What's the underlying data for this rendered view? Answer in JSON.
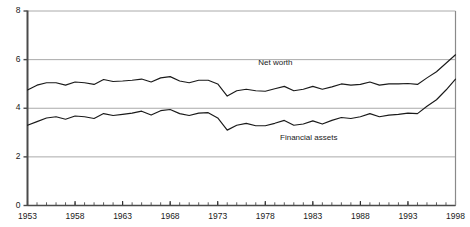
{
  "chart_data": {
    "type": "line",
    "title": "",
    "title_fragment": "Ratio",
    "xlabel": "",
    "ylabel": "",
    "xlim": [
      1953,
      1998
    ],
    "ylim": [
      0,
      8
    ],
    "yticks": [
      0,
      2,
      4,
      6,
      8
    ],
    "ytick_labels": [
      "0",
      "2",
      "4",
      "6",
      "8"
    ],
    "xticks": [
      1953,
      1958,
      1963,
      1968,
      1973,
      1978,
      1983,
      1988,
      1993,
      1998
    ],
    "xtick_labels": [
      "1953",
      "1958",
      "1963",
      "1968",
      "1973",
      "1978",
      "1983",
      "1988",
      "1993",
      "1998"
    ],
    "minor_xtick_interval": 1,
    "grid": "horizontal",
    "grid_color": "#aaaaaa",
    "line_color": "#1a1a1a",
    "legend_position": "inline-annotation",
    "x": [
      1953,
      1954,
      1955,
      1956,
      1957,
      1958,
      1959,
      1960,
      1961,
      1962,
      1963,
      1964,
      1965,
      1966,
      1967,
      1968,
      1969,
      1970,
      1971,
      1972,
      1973,
      1974,
      1975,
      1976,
      1977,
      1978,
      1979,
      1980,
      1981,
      1982,
      1983,
      1984,
      1985,
      1986,
      1987,
      1988,
      1989,
      1990,
      1991,
      1992,
      1993,
      1994,
      1995,
      1996,
      1997,
      1998
    ],
    "series": [
      {
        "name": "Net worth",
        "label": "Net worth",
        "label_x": 1979.2,
        "label_y": 5.85,
        "values": [
          4.75,
          4.95,
          5.05,
          5.05,
          4.95,
          5.08,
          5.05,
          4.98,
          5.18,
          5.1,
          5.12,
          5.15,
          5.2,
          5.08,
          5.25,
          5.3,
          5.12,
          5.05,
          5.15,
          5.15,
          5.0,
          4.5,
          4.72,
          4.78,
          4.72,
          4.7,
          4.8,
          4.9,
          4.72,
          4.78,
          4.9,
          4.78,
          4.88,
          5.0,
          4.95,
          4.98,
          5.08,
          4.95,
          5.0,
          5.0,
          5.02,
          4.98,
          5.25,
          5.5,
          5.85,
          6.2
        ]
      },
      {
        "name": "Financial assets",
        "label": "Financial assets",
        "label_x": 1983.0,
        "label_y": 2.78,
        "values": [
          3.3,
          3.45,
          3.6,
          3.65,
          3.55,
          3.68,
          3.65,
          3.58,
          3.78,
          3.7,
          3.75,
          3.8,
          3.88,
          3.72,
          3.9,
          3.95,
          3.78,
          3.7,
          3.8,
          3.82,
          3.6,
          3.1,
          3.3,
          3.38,
          3.28,
          3.28,
          3.38,
          3.5,
          3.3,
          3.35,
          3.48,
          3.35,
          3.5,
          3.62,
          3.58,
          3.65,
          3.78,
          3.65,
          3.72,
          3.75,
          3.8,
          3.78,
          4.08,
          4.35,
          4.75,
          5.2
        ]
      }
    ]
  }
}
